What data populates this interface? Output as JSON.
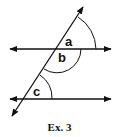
{
  "figure": {
    "caption": "Ex. 3",
    "angle_labels": {
      "a": "a",
      "b": "b",
      "c": "c"
    },
    "elements": {
      "parallel_lines": [
        "top-line",
        "bottom-line"
      ],
      "transversal": "transversal-line",
      "angles": [
        "a",
        "b",
        "c"
      ]
    },
    "colors": {
      "stroke": "#111111",
      "background": "#ffffff"
    }
  }
}
